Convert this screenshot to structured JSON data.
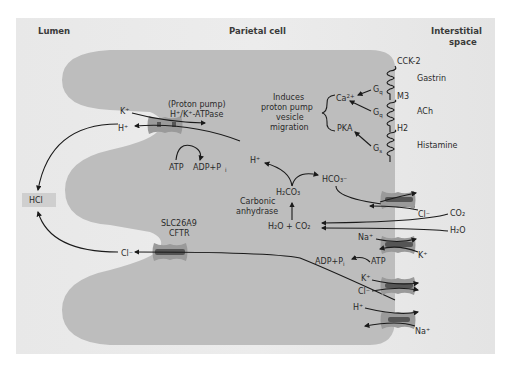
{
  "headers": {
    "lumen": "Lumen",
    "cell": "Parietal cell",
    "interstitial_line1": "Interstitial",
    "interstitial_line2": "space"
  },
  "lumen": {
    "hcl": "HCl"
  },
  "proton_pump": {
    "title_line1": "(Proton pump)",
    "title_line2": "H⁺/K⁺-ATPase",
    "k_ion": "K⁺",
    "h_ion": "H⁺",
    "atp": "ATP",
    "adp": "ADP+P",
    "adp_sub": "i"
  },
  "chloride_channel": {
    "title_line1": "SLC26A9",
    "title_line2": "CFTR",
    "cl_ion": "Cl⁻"
  },
  "receptors": [
    {
      "ligand": "Gastrin",
      "receptor": "CCK-2",
      "gprotein": "G",
      "gprotein_sub": "q"
    },
    {
      "ligand": "ACh",
      "receptor": "M3",
      "gprotein": "G",
      "gprotein_sub": "q"
    },
    {
      "ligand": "Histamine",
      "receptor": "H2",
      "gprotein": "G",
      "gprotein_sub": "s"
    }
  ],
  "signaling": {
    "ca": "Ca",
    "ca_sup": "2+",
    "pka": "PKA",
    "effect_line1": "Induces",
    "effect_line2": "proton pump",
    "effect_line3": "vesicle",
    "effect_line4": "migration"
  },
  "carbonic": {
    "h_ion": "H⁺",
    "h2co3": "H₂CO₃",
    "hco3": "HCO₃⁻",
    "enzyme_line1": "Carbonic",
    "enzyme_line2": "anhydrase",
    "reactants": "H₂O + CO₂"
  },
  "basolateral": {
    "cl_ion": "Cl⁻",
    "co2": "CO₂",
    "h2o": "H₂O",
    "na_ion_1": "Na⁺",
    "k_ion_1": "K⁺",
    "atp": "ATP",
    "adp": "ADP+P",
    "adp_sub": "i",
    "k_ion_2": "K⁺",
    "cl_ion_2": "Cl⁻",
    "h_ion": "H⁺",
    "na_ion_2": "Na⁺"
  },
  "colors": {
    "panel_bg": "#e6e6e6",
    "cell_fill": "#bdbdbd",
    "protein_fill": "#9a9a9a",
    "protein_core": "#555555",
    "hcl_box": "#cfcfcf",
    "arrow": "#1a1a1a"
  }
}
